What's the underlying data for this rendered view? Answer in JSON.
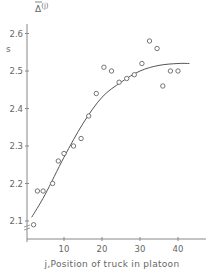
{
  "chart_data": {
    "type": "scatter",
    "title": "",
    "xlabel": "j,Position of truck in platoon",
    "ylabel": "Δ̄(j)",
    "ylabel_unit": "s",
    "xlim": [
      0,
      48
    ],
    "ylim": [
      2.05,
      2.62
    ],
    "x_ticks": [
      10,
      20,
      30,
      40
    ],
    "y_ticks": [
      2.1,
      2.2,
      2.3,
      2.4,
      2.5,
      2.6
    ],
    "x_tick_labels": [
      "10",
      "20",
      "30",
      "40"
    ],
    "y_tick_labels": [
      "2.1",
      "2.2",
      "2.3",
      "2.4",
      "2.5",
      "2.6"
    ],
    "grid": false,
    "legend": null,
    "series": [
      {
        "name": "observed",
        "marker": "open-circle",
        "points": [
          [
            2,
            2.09
          ],
          [
            3,
            2.18
          ],
          [
            4.5,
            2.18
          ],
          [
            7,
            2.2
          ],
          [
            8.5,
            2.26
          ],
          [
            10,
            2.28
          ],
          [
            12.5,
            2.3
          ],
          [
            14.5,
            2.32
          ],
          [
            16.5,
            2.38
          ],
          [
            18.5,
            2.44
          ],
          [
            20.5,
            2.51
          ],
          [
            22.5,
            2.5
          ],
          [
            24.5,
            2.47
          ],
          [
            26.5,
            2.48
          ],
          [
            28.5,
            2.49
          ],
          [
            30.5,
            2.52
          ],
          [
            32.5,
            2.58
          ],
          [
            34.5,
            2.56
          ],
          [
            36,
            2.46
          ],
          [
            38,
            2.5
          ],
          [
            40,
            2.5
          ]
        ]
      },
      {
        "name": "fitted curve",
        "marker": "line",
        "points": [
          [
            1.5,
            2.11
          ],
          [
            5,
            2.17
          ],
          [
            10,
            2.27
          ],
          [
            15,
            2.36
          ],
          [
            20,
            2.43
          ],
          [
            25,
            2.47
          ],
          [
            30,
            2.5
          ],
          [
            35,
            2.515
          ],
          [
            40,
            2.52
          ],
          [
            43,
            2.52
          ]
        ]
      }
    ]
  }
}
